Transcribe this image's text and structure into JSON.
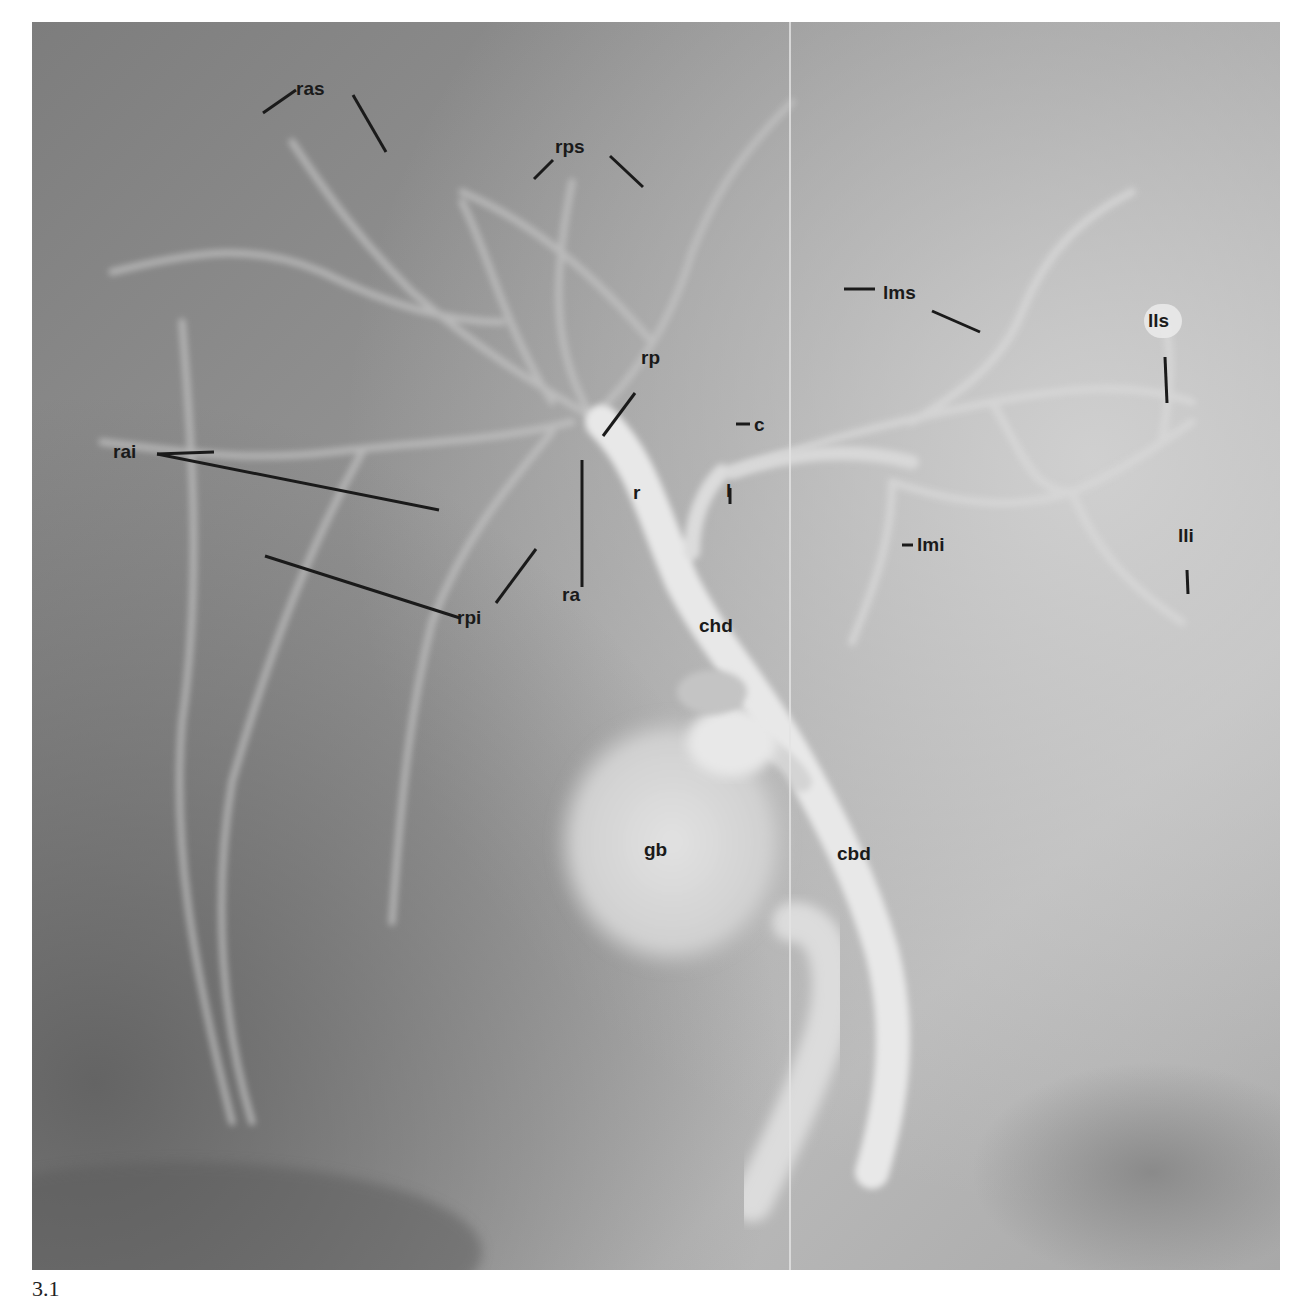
{
  "page": {
    "header_text": "",
    "figure_number": "3.1"
  },
  "figure": {
    "kind": "cholangiogram radiograph",
    "colors": {
      "background_dark": "#6f6f6f",
      "background_mid": "#9a9a9a",
      "duct_light": "#e6e6e6",
      "label": "#1a1a1a"
    },
    "labels": {
      "ras": "ras",
      "rps": "rps",
      "lms": "lms",
      "lls": "lls",
      "rp": "rp",
      "c": "c",
      "rai": "rai",
      "r": "r",
      "l": "l",
      "lmi": "lmi",
      "lli": "lli",
      "ra": "ra",
      "rpi": "rpi",
      "chd": "chd",
      "gb": "gb",
      "cbd": "cbd"
    }
  }
}
